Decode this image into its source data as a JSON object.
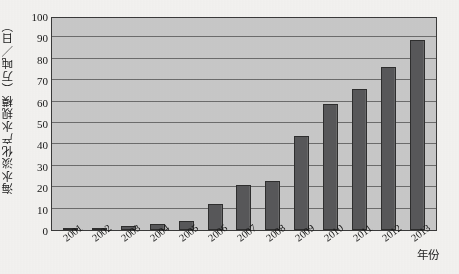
{
  "chart_data": {
    "type": "bar",
    "title": "",
    "xlabel": "年份",
    "ylabel": "海水淡化产水规模（万吨／日）",
    "categories": [
      "2001",
      "2002",
      "2003",
      "2004",
      "2005",
      "2006",
      "2007",
      "2008",
      "2009",
      "2010",
      "2011",
      "2012",
      "2013"
    ],
    "values": [
      1,
      1,
      2,
      3,
      4,
      12,
      21,
      23,
      44,
      59,
      66,
      76,
      89
    ],
    "ylim": [
      0,
      100
    ],
    "yticks": [
      0,
      10,
      20,
      30,
      40,
      50,
      60,
      70,
      80,
      90,
      100
    ],
    "ytick_labels": [
      "0",
      "10",
      "20",
      "30",
      "40",
      "50",
      "60",
      "70",
      "80",
      "90",
      "100"
    ],
    "grid": true,
    "legend": null,
    "series": [
      {
        "name": "海水淡化产水规模",
        "values": [
          1,
          1,
          2,
          3,
          4,
          12,
          21,
          23,
          44,
          59,
          66,
          76,
          89
        ]
      }
    ],
    "colors": {
      "bar": "#58585a",
      "bar_edge": "#2e2e2e",
      "plot_background": "#c9c9c9",
      "gridline": "#6d6d6d",
      "axis": "#3a3a3a",
      "text": "#171717",
      "page_background": "#f4f3f1"
    }
  }
}
